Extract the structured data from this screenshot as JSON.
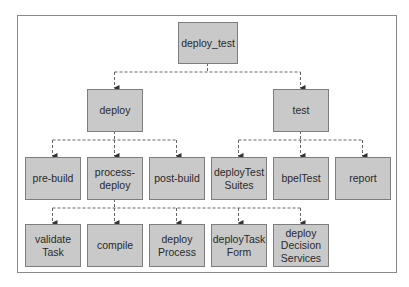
{
  "diagram": {
    "type": "tree",
    "root": {
      "label": "deploy_test",
      "children": [
        {
          "label": "deploy",
          "children": [
            {
              "label": "pre-build"
            },
            {
              "label": "process-\ndeploy",
              "children": [
                {
                  "label": "validate\nTask"
                },
                {
                  "label": "compile"
                },
                {
                  "label": "deploy\nProcess"
                },
                {
                  "label": "deployTask\nForm"
                },
                {
                  "label": "deploy\nDecision\nServices"
                }
              ]
            },
            {
              "label": "post-build"
            }
          ]
        },
        {
          "label": "test",
          "children": [
            {
              "label": "deployTest\nSuites"
            },
            {
              "label": "bpelTest"
            },
            {
              "label": "report"
            }
          ]
        }
      ]
    },
    "nodes": {
      "deploy_test": "deploy_test",
      "deploy": "deploy",
      "test": "test",
      "pre_build": "pre-build",
      "process_deploy": "process-\ndeploy",
      "post_build": "post-build",
      "deploy_test_suites": "deployTest\nSuites",
      "bpel_test": "bpelTest",
      "report": "report",
      "validate_task": "validate\nTask",
      "compile": "compile",
      "deploy_process": "deploy\nProcess",
      "deploy_task_form": "deployTask\nForm",
      "deploy_decision_services": "deploy\nDecision\nServices"
    },
    "colors": {
      "node_fill": "#c9c9c9",
      "node_border": "#7d7d7d",
      "connector": "#555555",
      "frame_border": "#8a8a8a"
    }
  }
}
